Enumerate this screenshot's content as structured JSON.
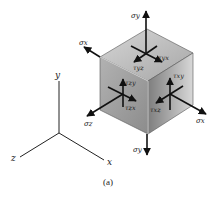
{
  "figure": {
    "caption": "(a)",
    "colors": {
      "background": "#ffffff",
      "top_face_light": "#d2d2d2",
      "top_face_dark": "#a8a8a8",
      "left_face": "#9c9c9c",
      "right_face_dark": "#8a8a8a",
      "right_face_light": "#d4d4d4",
      "lines": "#111111"
    }
  },
  "axes": {
    "labels": {
      "x": "x",
      "y": "y",
      "z": "z"
    }
  },
  "stresses": {
    "sigma_y_top": "σy",
    "sigma_y_bottom": "σy",
    "sigma_x_left": "σx",
    "sigma_x_right": "σx",
    "sigma_z": "σz",
    "tau_yx": "τyx",
    "tau_yz": "τyz",
    "tau_zy": "τzy",
    "tau_zx": "τzx",
    "tau_xy": "τxy",
    "tau_xz": "τxz"
  }
}
